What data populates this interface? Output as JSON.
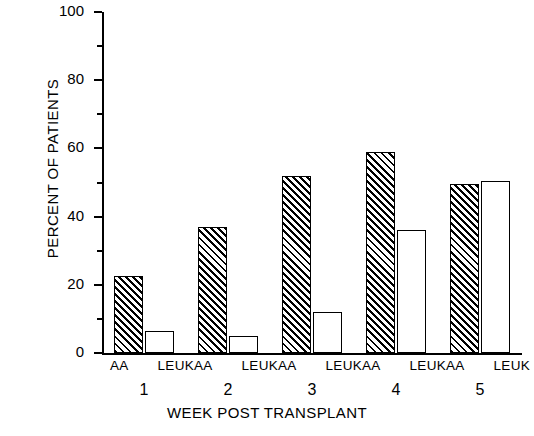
{
  "chart_data": {
    "type": "bar",
    "title": "",
    "xlabel": "WEEK POST TRANSPLANT",
    "ylabel": "PERCENT OF PATIENTS",
    "categories": [
      "1",
      "2",
      "3",
      "4",
      "5"
    ],
    "group_tick_labels": [
      "AA",
      "LEUK"
    ],
    "series": [
      {
        "name": "AA",
        "fill": "hatched",
        "values": [
          22.5,
          37,
          52,
          59,
          49.5
        ]
      },
      {
        "name": "LEUK",
        "fill": "white",
        "values": [
          6.5,
          5,
          12,
          36,
          50.5
        ]
      }
    ],
    "ylim": [
      0,
      100
    ],
    "yticks": [
      0,
      20,
      40,
      60,
      80,
      100
    ],
    "ytick_labels": [
      "0",
      "20",
      "40",
      "60",
      "80",
      "100"
    ],
    "yminor_ticks": [
      10,
      30,
      50,
      70,
      90
    ],
    "grid": false,
    "legend": "none",
    "axis_color": "#000000",
    "bar_edge_color": "#000000",
    "background": "#ffffff"
  }
}
